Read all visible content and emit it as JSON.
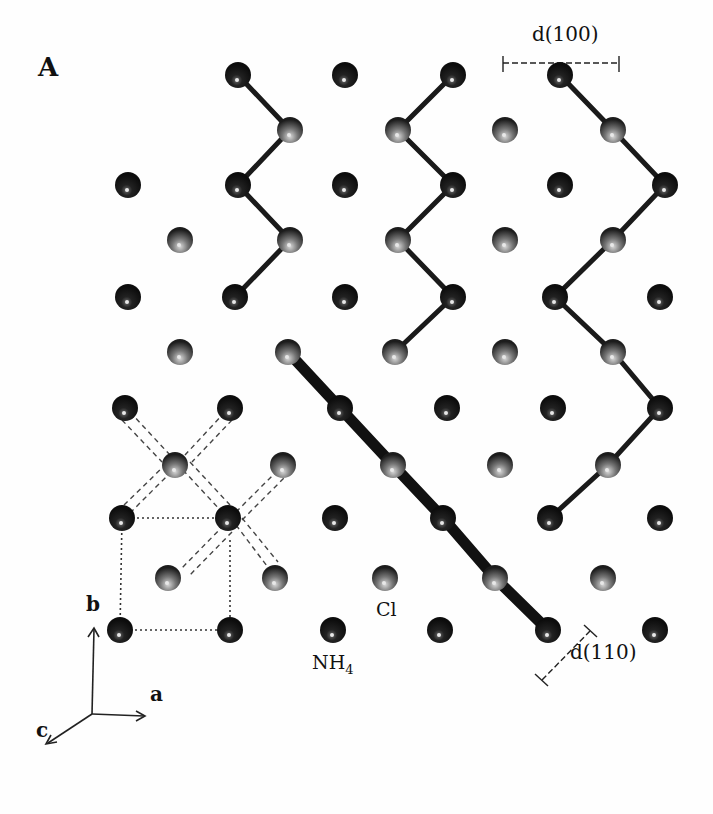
{
  "figure": {
    "panel_label": "A",
    "labels": {
      "d100": "d(100)",
      "d110": "d(110)",
      "cl": "Cl",
      "nh4_base": "NH",
      "nh4_sub": "4"
    },
    "axes": {
      "a": "a",
      "b": "b",
      "c": "c"
    },
    "colors": {
      "nh4_atom": "#111111",
      "cl_atom": "#555555",
      "bond": "#1a1a1a",
      "background": "#fefefe"
    },
    "atoms": {
      "nh4": [
        [
          238,
          75
        ],
        [
          345,
          75
        ],
        [
          453,
          75
        ],
        [
          560,
          75
        ],
        [
          128,
          185
        ],
        [
          238,
          185
        ],
        [
          345,
          185
        ],
        [
          453,
          185
        ],
        [
          560,
          185
        ],
        [
          665,
          185
        ],
        [
          128,
          297
        ],
        [
          235,
          297
        ],
        [
          345,
          297
        ],
        [
          453,
          297
        ],
        [
          555,
          297
        ],
        [
          660,
          297
        ],
        [
          125,
          408
        ],
        [
          230,
          408
        ],
        [
          340,
          408
        ],
        [
          447,
          408
        ],
        [
          553,
          408
        ],
        [
          660,
          408
        ],
        [
          122,
          518
        ],
        [
          228,
          518
        ],
        [
          335,
          518
        ],
        [
          443,
          518
        ],
        [
          550,
          518
        ],
        [
          660,
          518
        ],
        [
          120,
          630
        ],
        [
          230,
          630
        ],
        [
          333,
          630
        ],
        [
          440,
          630
        ],
        [
          548,
          630
        ],
        [
          655,
          630
        ]
      ],
      "cl": [
        [
          290,
          130
        ],
        [
          398,
          130
        ],
        [
          505,
          130
        ],
        [
          613,
          130
        ],
        [
          180,
          240
        ],
        [
          290,
          240
        ],
        [
          398,
          240
        ],
        [
          505,
          240
        ],
        [
          613,
          240
        ],
        [
          180,
          352
        ],
        [
          288,
          352
        ],
        [
          395,
          352
        ],
        [
          505,
          352
        ],
        [
          613,
          352
        ],
        [
          175,
          465
        ],
        [
          283,
          465
        ],
        [
          393,
          465
        ],
        [
          500,
          465
        ],
        [
          608,
          465
        ],
        [
          168,
          578
        ],
        [
          275,
          578
        ],
        [
          385,
          578
        ],
        [
          495,
          578
        ],
        [
          603,
          578
        ]
      ]
    }
  }
}
